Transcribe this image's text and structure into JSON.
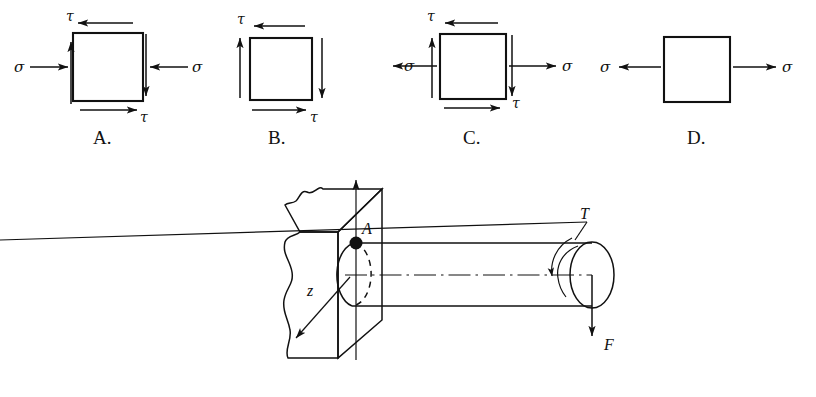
{
  "figure": {
    "line_color": "#111111",
    "background": "#ffffff"
  },
  "options": [
    {
      "id": "A",
      "letter": "A.",
      "normal_stress_label": "σ",
      "normal_stress_left": "σ",
      "normal_stress_right": "σ",
      "normal_stress_sense": "compression",
      "shear_label_top": "τ",
      "shear_label_bottom": "τ",
      "has_shear": true,
      "has_normal": true,
      "top_arrow_direction": "left",
      "bottom_arrow_direction": "right",
      "left_arrow_direction": "up",
      "right_arrow_direction": "down"
    },
    {
      "id": "B",
      "letter": "B.",
      "normal_stress_label": "",
      "normal_stress_left": "",
      "normal_stress_right": "",
      "normal_stress_sense": "none",
      "shear_label_top": "τ",
      "shear_label_bottom": "τ",
      "has_shear": true,
      "has_normal": false,
      "top_arrow_direction": "left",
      "bottom_arrow_direction": "right",
      "left_arrow_direction": "up",
      "right_arrow_direction": "down"
    },
    {
      "id": "C",
      "letter": "C.",
      "normal_stress_label": "σ",
      "normal_stress_left": "σ",
      "normal_stress_right": "σ",
      "normal_stress_sense": "tension",
      "shear_label_top": "τ",
      "shear_label_bottom": "τ",
      "has_shear": true,
      "has_normal": true,
      "top_arrow_direction": "left",
      "bottom_arrow_direction": "right",
      "left_arrow_direction": "up",
      "right_arrow_direction": "down"
    },
    {
      "id": "D",
      "letter": "D.",
      "normal_stress_label": "σ",
      "normal_stress_left": "σ",
      "normal_stress_right": "σ",
      "normal_stress_sense": "tension",
      "shear_label_top": "",
      "shear_label_bottom": "",
      "has_shear": false,
      "has_normal": true,
      "top_arrow_direction": "none",
      "bottom_arrow_direction": "none",
      "left_arrow_direction": "none",
      "right_arrow_direction": "none"
    }
  ],
  "shaft_diagram": {
    "point_label": "A",
    "axis_vertical_label": "",
    "axis_z_label": "z",
    "torque_label": "T",
    "force_label": "F",
    "wall_description": "broken-away wall block",
    "shaft_description": "cylindrical shaft cantilevered from wall"
  }
}
